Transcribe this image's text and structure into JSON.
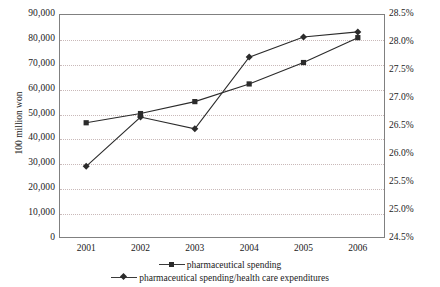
{
  "chart_data": {
    "type": "line",
    "title": "",
    "subtitle": "",
    "xlabel": "",
    "ylabel": "100 million won",
    "ylabel_right": "",
    "categories": [
      "2001",
      "2002",
      "2003",
      "2004",
      "2005",
      "2006"
    ],
    "grid": true,
    "legend_position": "bottom",
    "axes": {
      "left": {
        "label": "100 million won",
        "min": 0,
        "max": 90000,
        "step": 10000,
        "ticks": [
          "0",
          "10,000",
          "20,000",
          "30,000",
          "40,000",
          "50,000",
          "60,000",
          "70,000",
          "80,000",
          "90,000"
        ],
        "tick_values": [
          0,
          10000,
          20000,
          30000,
          40000,
          50000,
          60000,
          70000,
          80000,
          90000
        ]
      },
      "right": {
        "label": "",
        "min": 24.5,
        "max": 28.5,
        "step": 0.5,
        "ticks": [
          "24.5%",
          "25.0%",
          "25.5%",
          "26.0%",
          "26.5%",
          "27.0%",
          "27.5%",
          "28.0%",
          "28.5%"
        ],
        "tick_values": [
          24.5,
          25.0,
          25.5,
          26.0,
          26.5,
          27.0,
          27.5,
          28.0,
          28.5
        ]
      },
      "x": {
        "ticks": [
          "2001",
          "2002",
          "2003",
          "2004",
          "2005",
          "2006"
        ]
      }
    },
    "series": [
      {
        "name": "pharmaceutical spending",
        "axis": "left",
        "marker": "square",
        "color": "#2b2b2b",
        "values": [
          46300,
          50000,
          54800,
          61900,
          70500,
          80500
        ]
      },
      {
        "name": "pharmaceutical spending/health care expenditures",
        "axis": "right",
        "marker": "diamond",
        "color": "#2b2b2b",
        "values": [
          25.78,
          26.66,
          26.45,
          27.73,
          28.09,
          28.18
        ]
      }
    ],
    "legend": [
      {
        "label": "pharmaceutical spending",
        "marker": "square"
      },
      {
        "label": "pharmaceutical spending/health care expenditures",
        "marker": "diamond"
      }
    ]
  },
  "colors": {
    "series": "#2b2b2b",
    "grid": "#c9b9b9",
    "frame": "#808080",
    "text": "#1a1a1a",
    "background": "#ffffff"
  }
}
